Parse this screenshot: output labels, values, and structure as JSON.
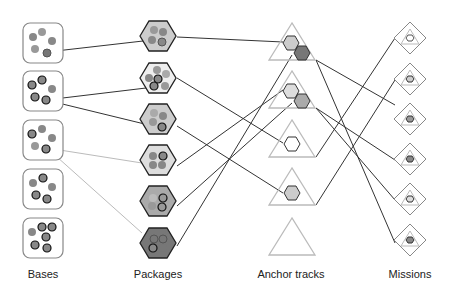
{
  "labels": {
    "bases": "Bases",
    "packages": "Packages",
    "anchor_tracks": "Anchor tracks",
    "missions": "Missions"
  },
  "colors": {
    "line_dark": "#333333",
    "line_light": "#bbbbbb",
    "box_border": "#888888",
    "triangle": "#bbbbbb",
    "dot_gray": "#888888",
    "dot_dark_border": "#222222",
    "hex_light": "#dddddd",
    "hex_mid": "#bbbbbb",
    "hex_dark": "#888888"
  },
  "columns": {
    "bases": {
      "count": 5,
      "x": 43
    },
    "packages": {
      "count": 6,
      "x": 158
    },
    "anchor_tracks": {
      "count": 5,
      "x": 291
    },
    "missions": {
      "count": 6,
      "x": 410
    }
  }
}
